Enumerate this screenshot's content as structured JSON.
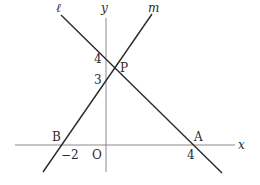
{
  "diagram": {
    "axes": {
      "x_label": "x",
      "y_label": "y",
      "origin_label": "O"
    },
    "lines": [
      {
        "name": "ℓ",
        "through": [
          [
            4,
            0
          ],
          [
            0,
            4
          ]
        ],
        "equation": "y = -x + 4"
      },
      {
        "name": "m",
        "through": [
          [
            -2,
            0
          ],
          [
            0,
            3
          ]
        ],
        "equation": "y = 3/2 x + 3"
      }
    ],
    "points": [
      {
        "label": "P",
        "coords": [
          0.4,
          3.6
        ],
        "desc": "intersection of ℓ and m"
      },
      {
        "label": "A",
        "coords": [
          4,
          0
        ]
      },
      {
        "label": "B",
        "coords": [
          -2,
          0
        ]
      }
    ],
    "tick_labels": {
      "y_4": "4",
      "y_3": "3",
      "x_neg2": "−2",
      "x_4": "4"
    },
    "labels": {
      "line_l": "ℓ",
      "line_m": "m",
      "point_P": "P",
      "point_A": "A",
      "point_B": "B"
    },
    "colors": {
      "axis": "#8a8a8a",
      "line": "#2a2a2a",
      "text": "#2a2a2a"
    }
  }
}
